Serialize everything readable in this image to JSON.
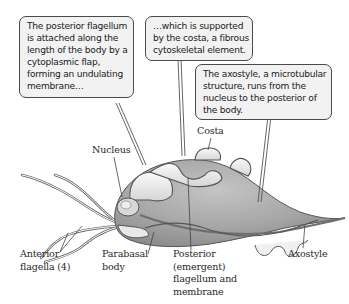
{
  "diagram": {
    "callouts": [
      {
        "id": "undulating-membrane",
        "lines": [
          "The posterior flagellum",
          "is attached along the",
          "length of the body by a",
          "cytoplasmic flap,",
          "forming an undulating",
          "membrane…"
        ]
      },
      {
        "id": "costa",
        "lines": [
          "…which is supported",
          "by the costa, a fibrous",
          "cytoskeletal element."
        ]
      },
      {
        "id": "axostyle",
        "lines": [
          "The axostyle, a microtubular",
          "structure, runs from the",
          "nucleus to the posterior of",
          "the body."
        ]
      }
    ],
    "labels": {
      "nucleus": [
        "Nucleus"
      ],
      "costa": [
        "Costa"
      ],
      "anterior_flagella": [
        "Anterior",
        "flagella (4)"
      ],
      "parabasal_body": [
        "Parabasal",
        "body"
      ],
      "posterior_flagellum": [
        "Posterior",
        "(emergent)",
        "flagellum and",
        "membrane"
      ],
      "axostyle": [
        "Axostyle"
      ]
    },
    "colors": {
      "body_fill": "#a8a8a8",
      "body_stroke": "#5a5a5a",
      "callout_fill": "#f2f2f2",
      "callout_border": "#4a4a4a",
      "text": "#1a1a1a",
      "leader_line": "#555555"
    }
  }
}
